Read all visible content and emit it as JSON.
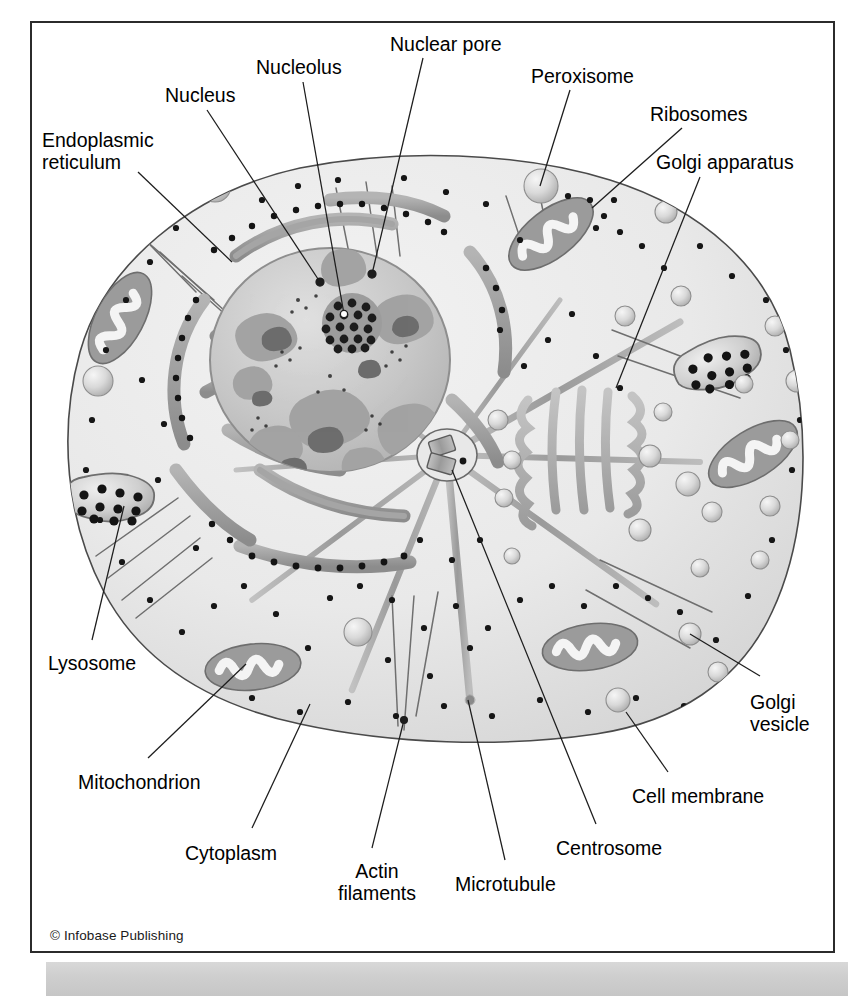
{
  "figure": {
    "credit": "© Infobase Publishing",
    "colors": {
      "frame_border": "#2b2b2b",
      "label_text": "#000000",
      "cytoplasm": "#ebebeb",
      "membrane_line": "#555555",
      "nucleus_light": "#cfcfcf",
      "chromatin_mid": "#a9a9a9",
      "chromatin_dark": "#6f6f6f",
      "er_membrane": "#9a9a9a",
      "ribosome_dot": "#111111",
      "golgi_body": "#b0b0b0",
      "vesicle": "#d3d3d3",
      "microtubule": "#9d9d9d",
      "actin_filament": "#6d6d6d",
      "bottom_strip": "#cfcfcf"
    }
  },
  "labels": [
    {
      "id": "nuclear-pore",
      "text": "Nuclear pore",
      "x": 390,
      "y": 34,
      "align": "left"
    },
    {
      "id": "nucleolus",
      "text": "Nucleolus",
      "x": 256,
      "y": 57,
      "align": "left"
    },
    {
      "id": "peroxisome",
      "text": "Peroxisome",
      "x": 531,
      "y": 66,
      "align": "left"
    },
    {
      "id": "nucleus",
      "text": "Nucleus",
      "x": 165,
      "y": 85,
      "align": "left"
    },
    {
      "id": "ribosomes",
      "text": "Ribosomes",
      "x": 650,
      "y": 104,
      "align": "left"
    },
    {
      "id": "endoplasmic-reticulum",
      "text": "Endoplasmic\nreticulum",
      "x": 42,
      "y": 130,
      "align": "left"
    },
    {
      "id": "golgi-apparatus",
      "text": "Golgi apparatus",
      "x": 656,
      "y": 152,
      "align": "left"
    },
    {
      "id": "lysosome",
      "text": "Lysosome",
      "x": 48,
      "y": 653,
      "align": "left"
    },
    {
      "id": "golgi-vesicle",
      "text": "Golgi\nvesicle",
      "x": 750,
      "y": 692,
      "align": "left"
    },
    {
      "id": "mitochondrion",
      "text": "Mitochondrion",
      "x": 78,
      "y": 772,
      "align": "left"
    },
    {
      "id": "cell-membrane",
      "text": "Cell membrane",
      "x": 632,
      "y": 786,
      "align": "left"
    },
    {
      "id": "centrosome",
      "text": "Centrosome",
      "x": 556,
      "y": 838,
      "align": "left"
    },
    {
      "id": "cytoplasm",
      "text": "Cytoplasm",
      "x": 185,
      "y": 843,
      "align": "left"
    },
    {
      "id": "actin-filaments",
      "text": "Actin\nfilaments",
      "x": 338,
      "y": 861,
      "align": "left"
    },
    {
      "id": "microtubule",
      "text": "Microtubule",
      "x": 455,
      "y": 874,
      "align": "left"
    }
  ],
  "leaders": [
    {
      "id": "leader-nuclear-pore",
      "from": [
        423,
        58
      ],
      "to": [
        372,
        274
      ]
    },
    {
      "id": "leader-nucleolus",
      "from": [
        303,
        82
      ],
      "to": [
        344,
        314
      ]
    },
    {
      "id": "leader-peroxisome",
      "from": [
        570,
        90
      ],
      "to": [
        540,
        186
      ]
    },
    {
      "id": "leader-nucleus",
      "from": [
        207,
        110
      ],
      "to": [
        320,
        282
      ]
    },
    {
      "id": "leader-ribosomes",
      "from": [
        682,
        128
      ],
      "to": [
        592,
        208
      ]
    },
    {
      "id": "leader-endoplasmic-reticulum",
      "from": [
        138,
        172
      ],
      "to": [
        232,
        262
      ]
    },
    {
      "id": "leader-golgi-apparatus",
      "from": [
        700,
        177
      ],
      "to": [
        616,
        388
      ]
    },
    {
      "id": "leader-lysosome",
      "from": [
        92,
        640
      ],
      "to": [
        124,
        506
      ]
    },
    {
      "id": "leader-golgi-vesicle",
      "from": [
        760,
        676
      ],
      "to": [
        690,
        634
      ]
    },
    {
      "id": "leader-mitochondrion",
      "from": [
        148,
        758
      ],
      "to": [
        246,
        664
      ]
    },
    {
      "id": "leader-cell-membrane",
      "from": [
        668,
        772
      ],
      "to": [
        626,
        712
      ]
    },
    {
      "id": "leader-centrosome",
      "from": [
        596,
        824
      ],
      "to": [
        452,
        470
      ]
    },
    {
      "id": "leader-cytoplasm",
      "from": [
        252,
        828
      ],
      "to": [
        310,
        704
      ]
    },
    {
      "id": "leader-actin-filaments",
      "from": [
        372,
        848
      ],
      "to": [
        404,
        720
      ]
    },
    {
      "id": "leader-microtubule",
      "from": [
        505,
        860
      ],
      "to": [
        468,
        700
      ]
    }
  ],
  "organelles": {
    "nucleus": {
      "cx": 330,
      "cy": 360,
      "rx": 120,
      "ry": 112
    },
    "nucleolus": {
      "cx": 352,
      "cy": 323,
      "r": 30,
      "granule_count": 34
    },
    "centrosome": {
      "cx": 447,
      "cy": 455,
      "rx": 30,
      "ry": 26,
      "centriole_count": 2
    },
    "golgi": {
      "cx": 577,
      "cy": 450,
      "cisternae": 5
    },
    "mitochondria": [
      {
        "cx": 120,
        "cy": 318,
        "angle": -62
      },
      {
        "cx": 551,
        "cy": 234,
        "angle": -38
      },
      {
        "cx": 753,
        "cy": 454,
        "angle": -32
      },
      {
        "cx": 253,
        "cy": 667,
        "angle": -6
      },
      {
        "cx": 590,
        "cy": 647,
        "angle": -8
      }
    ],
    "lysosomes": [
      {
        "cx": 112,
        "cy": 503,
        "dots": 11
      },
      {
        "cx": 722,
        "cy": 368,
        "dots": 11
      }
    ],
    "peroxisome": {
      "cx": 541,
      "cy": 186,
      "r": 17
    },
    "vesicle_count": 26,
    "ribosome_dot_count": 120,
    "microtubule_count": 9,
    "actin_filament_count": 18,
    "er_arc_count": 9
  }
}
